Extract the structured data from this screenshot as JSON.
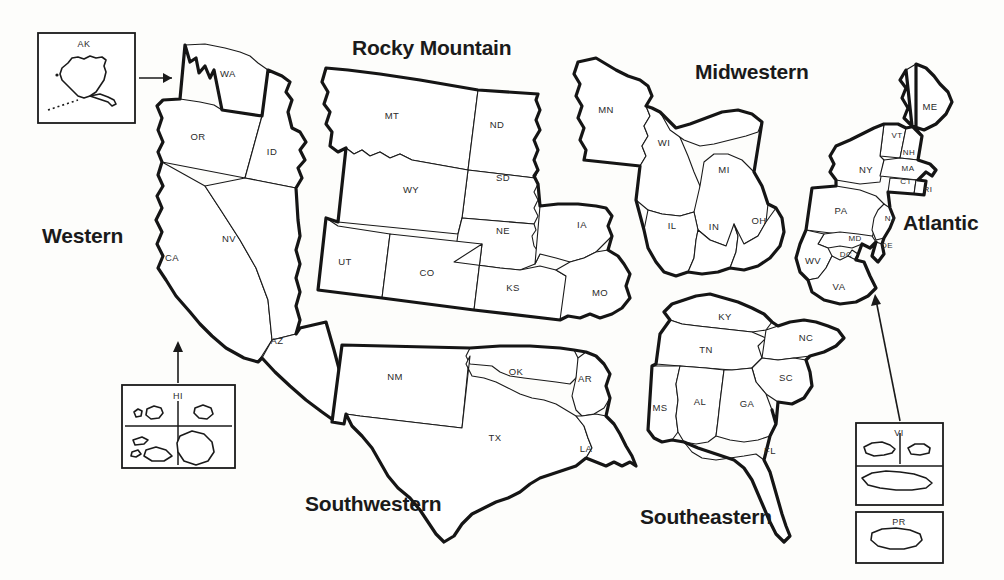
{
  "map": {
    "title": "United States Regional Map",
    "regions": [
      {
        "id": "western",
        "label": "Western",
        "x": 42,
        "y": 224
      },
      {
        "id": "rocky",
        "label": "Rocky Mountain",
        "x": 352,
        "y": 36
      },
      {
        "id": "midwestern",
        "label": "Midwestern",
        "x": 695,
        "y": 60
      },
      {
        "id": "atlantic",
        "label": "Atlantic",
        "x": 903,
        "y": 211
      },
      {
        "id": "southwestern",
        "label": "Southwestern",
        "x": 305,
        "y": 492
      },
      {
        "id": "southeastern",
        "label": "Southeastern",
        "x": 640,
        "y": 505
      }
    ],
    "states": [
      {
        "code": "WA",
        "name": "Washington",
        "x": 228,
        "y": 74,
        "region": "western"
      },
      {
        "code": "OR",
        "name": "Oregon",
        "x": 198,
        "y": 137,
        "region": "western"
      },
      {
        "code": "ID",
        "name": "Idaho",
        "x": 272,
        "y": 152,
        "region": "western"
      },
      {
        "code": "CA",
        "name": "California",
        "x": 172,
        "y": 258,
        "region": "western"
      },
      {
        "code": "NV",
        "name": "Nevada",
        "x": 229,
        "y": 239,
        "region": "western"
      },
      {
        "code": "AZ",
        "name": "Arizona",
        "x": 277,
        "y": 341,
        "region": "western"
      },
      {
        "code": "MT",
        "name": "Montana",
        "x": 392,
        "y": 116,
        "region": "rocky"
      },
      {
        "code": "ND",
        "name": "North Dakota",
        "x": 497,
        "y": 125,
        "region": "rocky"
      },
      {
        "code": "SD",
        "name": "South Dakota",
        "x": 503,
        "y": 178,
        "region": "rocky"
      },
      {
        "code": "WY",
        "name": "Wyoming",
        "x": 411,
        "y": 190,
        "region": "rocky"
      },
      {
        "code": "NE",
        "name": "Nebraska",
        "x": 503,
        "y": 231,
        "region": "rocky"
      },
      {
        "code": "UT",
        "name": "Utah",
        "x": 345,
        "y": 262,
        "region": "rocky"
      },
      {
        "code": "CO",
        "name": "Colorado",
        "x": 427,
        "y": 273,
        "region": "rocky"
      },
      {
        "code": "KS",
        "name": "Kansas",
        "x": 513,
        "y": 288,
        "region": "rocky"
      },
      {
        "code": "IA",
        "name": "Iowa",
        "x": 582,
        "y": 225,
        "region": "rocky"
      },
      {
        "code": "MO",
        "name": "Missouri",
        "x": 600,
        "y": 293,
        "region": "rocky"
      },
      {
        "code": "MN",
        "name": "Minnesota",
        "x": 606,
        "y": 110,
        "region": "midwestern"
      },
      {
        "code": "WI",
        "name": "Wisconsin",
        "x": 664,
        "y": 143,
        "region": "midwestern"
      },
      {
        "code": "MI",
        "name": "Michigan",
        "x": 724,
        "y": 170,
        "region": "midwestern"
      },
      {
        "code": "IL",
        "name": "Illinois",
        "x": 672,
        "y": 226,
        "region": "midwestern"
      },
      {
        "code": "IN",
        "name": "Indiana",
        "x": 714,
        "y": 227,
        "region": "midwestern"
      },
      {
        "code": "OH",
        "name": "Ohio",
        "x": 759,
        "y": 221,
        "region": "midwestern"
      },
      {
        "code": "ME",
        "name": "Maine",
        "x": 930,
        "y": 107,
        "region": "atlantic"
      },
      {
        "code": "VT",
        "name": "Vermont",
        "x": 897,
        "y": 136,
        "region": "atlantic"
      },
      {
        "code": "NH",
        "name": "New Hampshire",
        "x": 909,
        "y": 153,
        "region": "atlantic"
      },
      {
        "code": "NY",
        "name": "New York",
        "x": 866,
        "y": 170,
        "region": "atlantic"
      },
      {
        "code": "MA",
        "name": "Massachusetts",
        "x": 908,
        "y": 169,
        "region": "atlantic"
      },
      {
        "code": "CT",
        "name": "Connecticut",
        "x": 906,
        "y": 182,
        "region": "atlantic"
      },
      {
        "code": "RI",
        "name": "Rhode Island",
        "x": 928,
        "y": 190,
        "region": "atlantic"
      },
      {
        "code": "PA",
        "name": "Pennsylvania",
        "x": 841,
        "y": 211,
        "region": "atlantic"
      },
      {
        "code": "NJ",
        "name": "New Jersey",
        "x": 890,
        "y": 219,
        "region": "atlantic"
      },
      {
        "code": "MD",
        "name": "Maryland",
        "x": 855,
        "y": 239,
        "region": "atlantic"
      },
      {
        "code": "DC",
        "name": "District of Columbia",
        "x": 846,
        "y": 255,
        "region": "atlantic"
      },
      {
        "code": "DE",
        "name": "Delaware",
        "x": 887,
        "y": 246,
        "region": "atlantic"
      },
      {
        "code": "WV",
        "name": "West Virginia",
        "x": 813,
        "y": 261,
        "region": "atlantic"
      },
      {
        "code": "VA",
        "name": "Virginia",
        "x": 839,
        "y": 287,
        "region": "atlantic"
      },
      {
        "code": "NM",
        "name": "New Mexico",
        "x": 395,
        "y": 377,
        "region": "southwestern"
      },
      {
        "code": "OK",
        "name": "Oklahoma",
        "x": 516,
        "y": 372,
        "region": "southwestern"
      },
      {
        "code": "AR",
        "name": "Arkansas",
        "x": 585,
        "y": 379,
        "region": "southwestern"
      },
      {
        "code": "TX",
        "name": "Texas",
        "x": 495,
        "y": 438,
        "region": "southwestern"
      },
      {
        "code": "LA",
        "name": "Louisiana",
        "x": 586,
        "y": 449,
        "region": "southwestern"
      },
      {
        "code": "KY",
        "name": "Kentucky",
        "x": 725,
        "y": 317,
        "region": "southeastern"
      },
      {
        "code": "TN",
        "name": "Tennessee",
        "x": 706,
        "y": 350,
        "region": "southeastern"
      },
      {
        "code": "NC",
        "name": "North Carolina",
        "x": 806,
        "y": 338,
        "region": "southeastern"
      },
      {
        "code": "SC",
        "name": "South Carolina",
        "x": 786,
        "y": 378,
        "region": "southeastern"
      },
      {
        "code": "MS",
        "name": "Mississippi",
        "x": 660,
        "y": 408,
        "region": "southeastern"
      },
      {
        "code": "AL",
        "name": "Alabama",
        "x": 700,
        "y": 402,
        "region": "southeastern"
      },
      {
        "code": "GA",
        "name": "Georgia",
        "x": 747,
        "y": 404,
        "region": "southeastern"
      },
      {
        "code": "FL",
        "name": "Florida",
        "x": 770,
        "y": 451,
        "region": "southeastern"
      }
    ],
    "insets": [
      {
        "id": "ak",
        "label": "AK",
        "label_x": 84,
        "label_y": 44,
        "box": [
          38,
          33,
          97,
          90
        ],
        "points_to": "western"
      },
      {
        "id": "hi",
        "label": "HI",
        "label_x": 178,
        "label_y": 397,
        "box": [
          122,
          385,
          113,
          83
        ],
        "points_to": "western"
      },
      {
        "id": "vi",
        "label": "VI",
        "label_x": 899,
        "label_y": 434,
        "box": [
          856,
          423,
          87,
          82
        ],
        "points_to": "atlantic"
      },
      {
        "id": "pr",
        "label": "PR",
        "label_x": 899,
        "label_y": 523,
        "box": [
          856,
          512,
          87,
          51
        ],
        "points_to": "atlantic"
      }
    ]
  }
}
